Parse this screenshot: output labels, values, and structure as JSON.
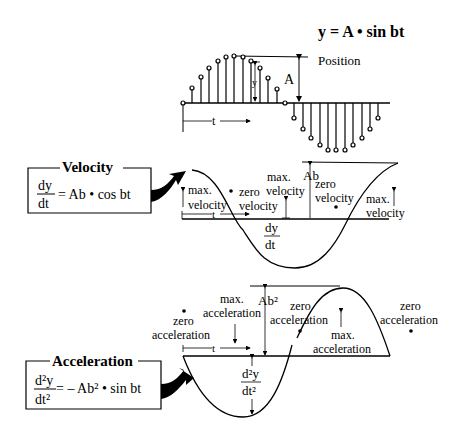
{
  "position": {
    "equation": "y = A • sin bt",
    "label": "Position",
    "amplitude_label": "A",
    "y_label": "y",
    "t_label": "t"
  },
  "velocity": {
    "box_title": "Velocity",
    "eq_num": "dy",
    "eq_den": "dt",
    "eq_rhs": "= Ab • cos bt",
    "max_label_1a": "max.",
    "max_label_1b": "velocity",
    "zero_label_1a": "zero",
    "zero_label_1b": "velocity",
    "max_label_2a": "max.",
    "max_label_2b": "velocity",
    "zero_label_2a": "zero",
    "zero_label_2b": "velocity",
    "max_label_3a": "max.",
    "max_label_3b": "velocity",
    "amplitude_label": "Ab",
    "t_label": "t",
    "deriv_num": "dy",
    "deriv_den": "dt"
  },
  "acceleration": {
    "box_title": "Acceleration",
    "eq_num": "d²y",
    "eq_den": "dt²",
    "eq_rhs": "= – Ab²  • sin bt",
    "zero_label_1a": "zero",
    "zero_label_1b": "acceleration",
    "max_label_1a": "max.",
    "max_label_1b": "acceleration",
    "amplitude_label": "Ab²",
    "zero_label_2a": "zero",
    "zero_label_2b": "acceleration",
    "max_label_2a": "max.",
    "max_label_2b": "acceleration",
    "zero_label_3a": "zero",
    "zero_label_3b": "acceleration",
    "t_label": "t",
    "deriv_num": "d²y",
    "deriv_den": "dt²"
  }
}
